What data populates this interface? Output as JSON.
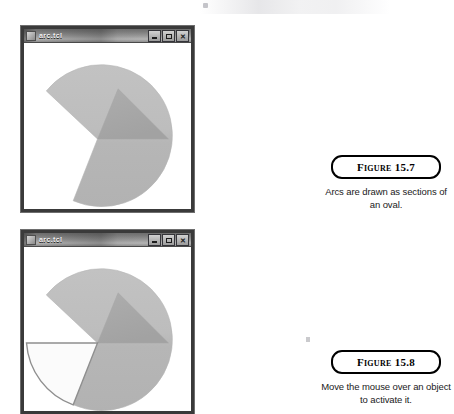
{
  "page": {
    "background": "#ffffff",
    "width": 454,
    "height": 414
  },
  "windows": [
    {
      "id": "window-1",
      "title": "arc.tcl",
      "icon": "app-icon",
      "buttons": [
        {
          "name": "minimize-button",
          "label": "_"
        },
        {
          "name": "maximize-button",
          "label": "□"
        },
        {
          "name": "close-button",
          "label": "✕"
        }
      ],
      "canvas": {
        "description": "pie-slice arc",
        "shapes": [
          {
            "name": "pieslice-arc",
            "type": "arc",
            "style": "pieslice",
            "start_deg": 250,
            "extent_deg": 290,
            "fill": "#b9b9b9",
            "outline": "#b9b9b9"
          },
          {
            "name": "highlight-wedge",
            "type": "arc",
            "style": "pieslice",
            "start_deg": 0,
            "extent_deg": 45,
            "fill": "#a5a5a5",
            "outline": "#a5a5a5"
          }
        ]
      }
    },
    {
      "id": "window-2",
      "title": "arc.tcl",
      "icon": "app-icon",
      "buttons": [
        {
          "name": "minimize-button",
          "label": "_"
        },
        {
          "name": "maximize-button",
          "label": "□"
        },
        {
          "name": "close-button",
          "label": "✕"
        }
      ],
      "canvas": {
        "description": "pie-slice arc with activated wedge",
        "shapes": [
          {
            "name": "pieslice-arc",
            "type": "arc",
            "style": "pieslice",
            "start_deg": 250,
            "extent_deg": 290,
            "fill": "#b9b9b9",
            "outline": "#b9b9b9"
          },
          {
            "name": "highlight-wedge",
            "type": "arc",
            "style": "pieslice",
            "start_deg": 0,
            "extent_deg": 45,
            "fill": "#a5a5a5",
            "outline": "#a5a5a5"
          },
          {
            "name": "activated-wedge",
            "type": "arc",
            "style": "pieslice",
            "start_deg": 180,
            "extent_deg": 70,
            "fill": "#fbfbfb",
            "outline": "#8a8a8a"
          }
        ]
      }
    }
  ],
  "figures": [
    {
      "id": "figure-1",
      "label": "Figure 15.7",
      "caption": "Arcs are drawn as sections of an oval."
    },
    {
      "id": "figure-2",
      "label": "Figure 15.8",
      "caption": "Move the mouse over an object to activate it."
    }
  ]
}
